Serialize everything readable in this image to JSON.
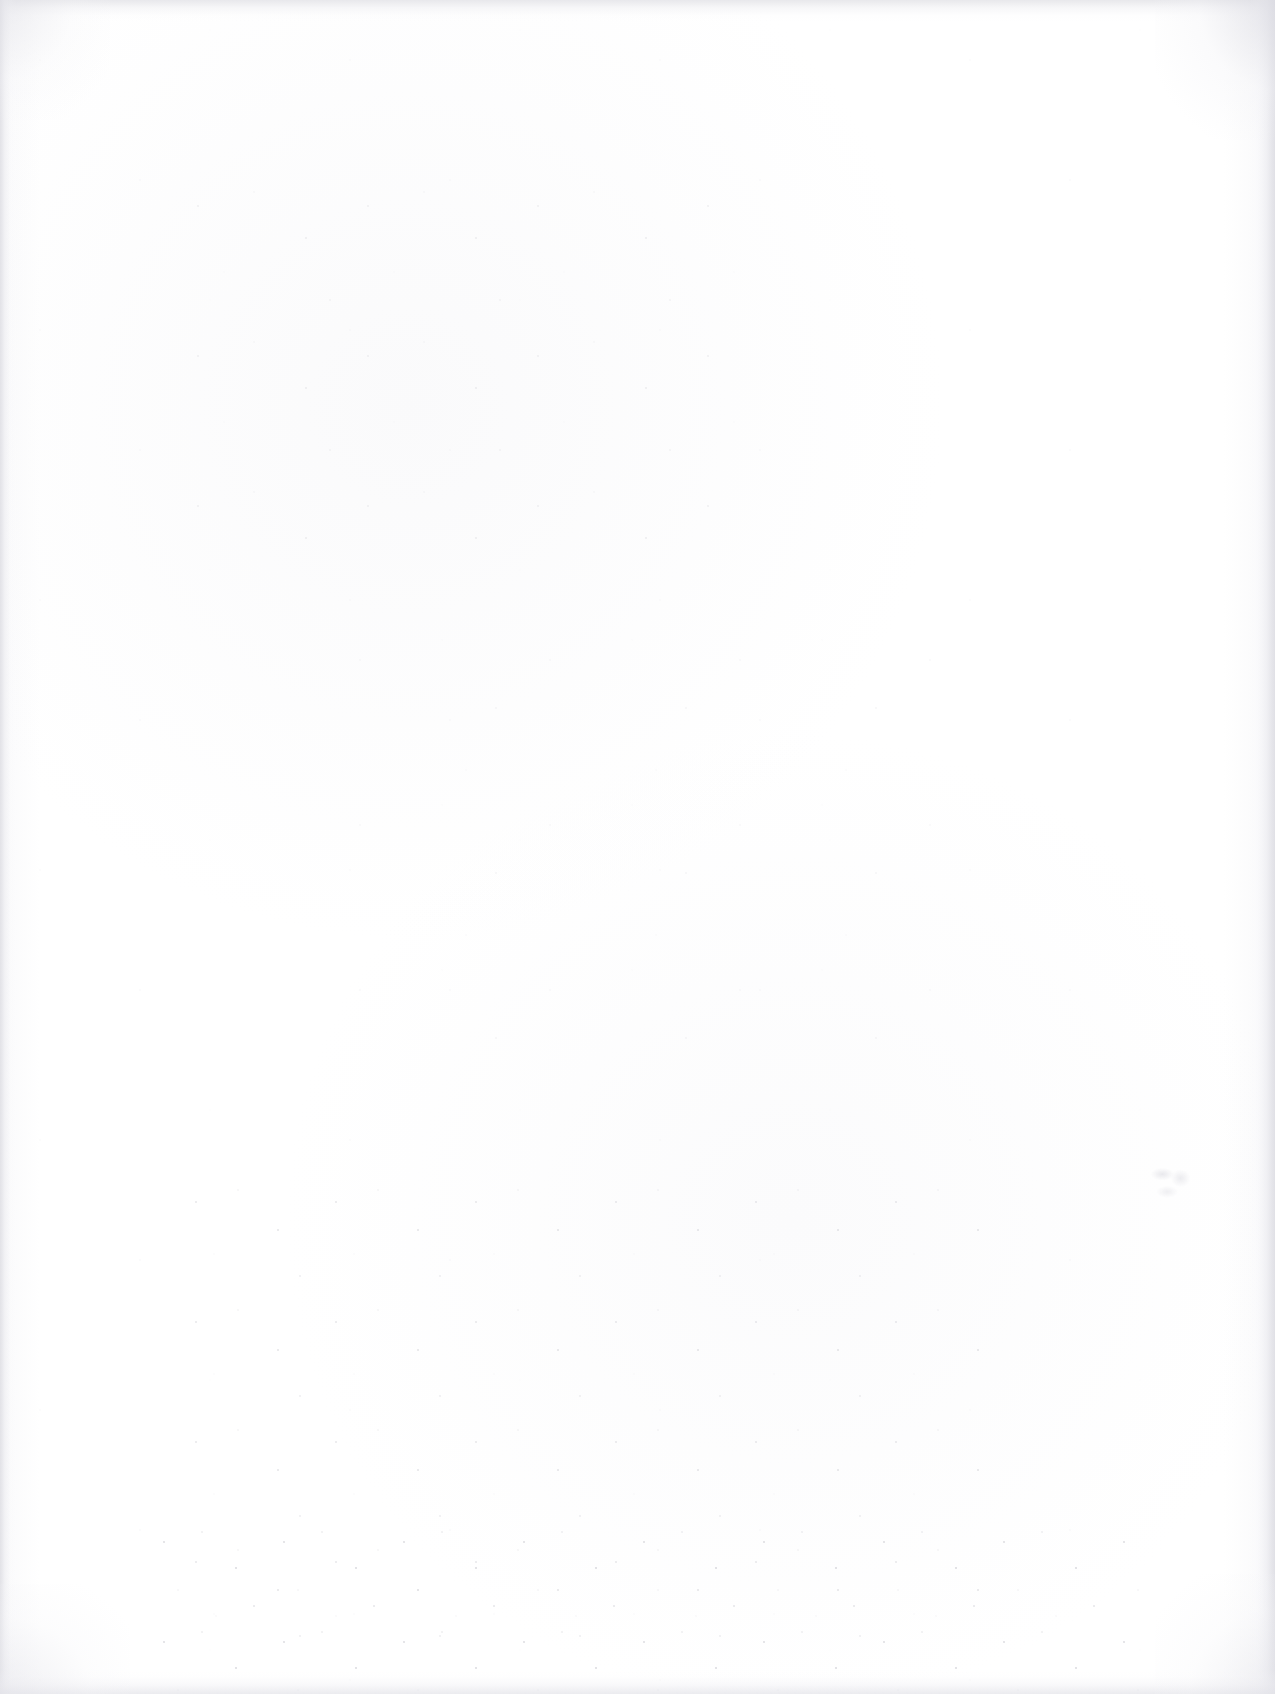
{
  "page": {
    "kind": "blank-scanned-page",
    "width": 1275,
    "height": 1694,
    "visible_text": "",
    "description": "Blank scanned paper page with no printed or handwritten text",
    "background_color": "#ffffff",
    "paper_tone": "#fdfdfe"
  },
  "scan_artifacts": {
    "edges": {
      "top": {
        "name": "top-scan-edge",
        "color": "#e4e4e8",
        "thickness_px": 22
      },
      "left": {
        "name": "left-scan-edge",
        "color": "#e0e0e5",
        "thickness_px": 16
      },
      "right": {
        "name": "right-scan-edge",
        "color": "#dfdfe5",
        "thickness_px": 26
      },
      "bottom": {
        "name": "bottom-scan-edge",
        "color": "#e6e6eb",
        "thickness_px": 24
      }
    },
    "corners": [
      "top-left",
      "top-right",
      "bottom-left",
      "bottom-right"
    ],
    "speckle_regions": [
      {
        "name": "upper-left-dust",
        "density": "moderate"
      },
      {
        "name": "mid-page-dust",
        "density": "light"
      },
      {
        "name": "lower-center-dust",
        "density": "heavy"
      },
      {
        "name": "bottom-band-dust",
        "density": "heavy"
      },
      {
        "name": "sparse-global-dust",
        "density": "very light"
      }
    ],
    "smudge": {
      "name": "faint-illegible-smudge",
      "x": 1148,
      "y": 1163,
      "width": 48,
      "height": 40,
      "color": "#c8c8d2",
      "note": "illegible faint mark, possibly pencil or show-through"
    }
  }
}
